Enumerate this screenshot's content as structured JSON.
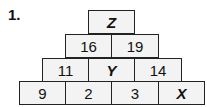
{
  "problem_number": "1.",
  "pyramid": {
    "row1": [
      "Z"
    ],
    "row2": [
      "16",
      "19"
    ],
    "row3": [
      "11",
      "Y",
      "14"
    ],
    "row4": [
      "9",
      "2",
      "3",
      "X"
    ]
  }
}
